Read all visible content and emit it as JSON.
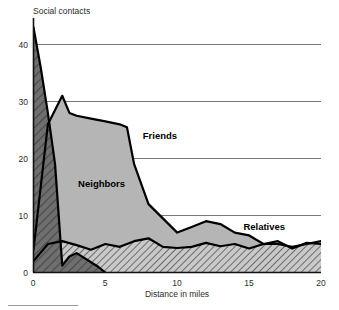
{
  "chart_data": {
    "type": "area",
    "title": "",
    "ylabel": "Social contacts",
    "xlabel": "Distance in miles",
    "xlim": [
      0,
      20
    ],
    "ylim": [
      0,
      44
    ],
    "xticks": [
      "0",
      "5",
      "10",
      "15",
      "20"
    ],
    "xtick_values": [
      0,
      5,
      10,
      15,
      20
    ],
    "yticks": [
      "0",
      "10",
      "20",
      "30",
      "40"
    ],
    "ytick_values": [
      0,
      10,
      20,
      30,
      40
    ],
    "grid": "horizontal",
    "legend_position": "inline-annotations",
    "stacking": "overlaid",
    "series": [
      {
        "name": "Neighbors",
        "fill": "#6e6e6e",
        "pattern": "diagonal-hatch-dark",
        "x": [
          0,
          0.5,
          1,
          1.5,
          2,
          2.5,
          3,
          3.5,
          4,
          4.5,
          5
        ],
        "values": [
          43,
          36,
          28,
          19,
          1.2,
          2.8,
          3.4,
          2.6,
          1.8,
          1.0,
          0
        ]
      },
      {
        "name": "Friends",
        "fill": "#b5b5b5",
        "pattern": "solid-gray",
        "x": [
          0,
          1,
          2,
          2.5,
          3,
          4,
          5,
          6,
          6.5,
          7,
          8,
          9,
          10,
          11,
          12,
          13,
          14,
          15,
          16,
          17,
          18,
          19,
          20
        ],
        "values": [
          4,
          26,
          31,
          28,
          27.5,
          27,
          26.5,
          26,
          25.5,
          19,
          12,
          9.5,
          7,
          8,
          9,
          8.5,
          7,
          6.5,
          5,
          5,
          4.5,
          5,
          5.5
        ]
      },
      {
        "name": "Relatives",
        "fill": "#8a8a8a",
        "pattern": "diagonal-hatch-light",
        "x": [
          0,
          1,
          2,
          3,
          4,
          5,
          6,
          7,
          8,
          9,
          10,
          11,
          12,
          13,
          14,
          15,
          16,
          17,
          18,
          19,
          20
        ],
        "values": [
          2,
          5,
          5.5,
          4.8,
          4,
          5,
          4.5,
          5.5,
          6,
          4.5,
          4.3,
          4.5,
          5.2,
          4.6,
          5,
          4.2,
          5,
          5.5,
          4.2,
          5.2,
          5
        ]
      }
    ],
    "annotations": [
      {
        "text": "Friends",
        "x": 7.6,
        "y": 23.5
      },
      {
        "text": "Neighbors",
        "x": 3.1,
        "y": 15.0
      },
      {
        "text": "Relatives",
        "x": 14.6,
        "y": 7.5
      }
    ]
  },
  "colors": {
    "axis": "#111111",
    "grid": "#555555",
    "text": "#2b2b2b",
    "neighbors_fill": "#6e6e6e",
    "friends_fill": "#b5b5b5",
    "relatives_fill": "#8a8a8a",
    "background": "#ffffff"
  }
}
